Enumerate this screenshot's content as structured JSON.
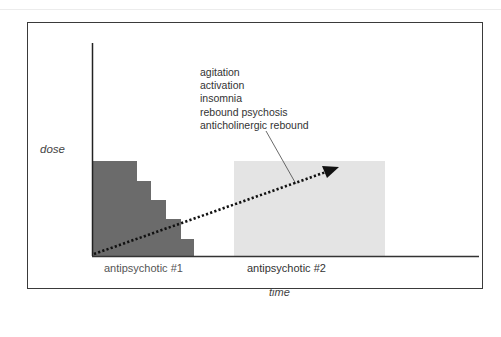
{
  "diagram": {
    "y_axis_label": "dose",
    "x_axis_label": "time",
    "drug1": {
      "label": "antipsychotic #1",
      "color": "#6b6b6b",
      "description": "tapering staircase dose"
    },
    "drug2": {
      "label": "antipsychotic #2",
      "color": "#e4e4e4",
      "description": "constant dose block"
    },
    "cross_titration_arrow": {
      "style": "dotted",
      "color": "#111111"
    },
    "effects": [
      "agitation",
      "activation",
      "insomnia",
      "rebound psychosis",
      "anticholinergic rebound"
    ]
  }
}
